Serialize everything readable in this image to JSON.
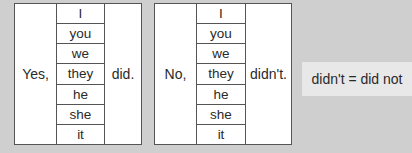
{
  "tables": [
    {
      "lead": "Yes,",
      "pronouns": [
        "I",
        "you",
        "we",
        "they",
        "he",
        "she",
        "it"
      ],
      "verb": "did."
    },
    {
      "lead": "No,",
      "pronouns": [
        "I",
        "you",
        "we",
        "they",
        "he",
        "she",
        "it"
      ],
      "verb": "didn't."
    }
  ],
  "note": "didn't  =  did not",
  "colors": {
    "background": "#cfcfcf",
    "table_bg": "#ffffff",
    "border": "#555555",
    "note_bg": "#e8e8e8"
  }
}
